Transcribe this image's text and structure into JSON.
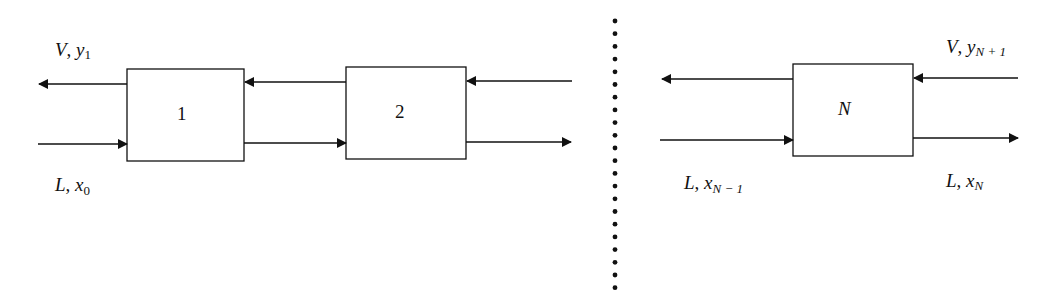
{
  "diagram": {
    "stages": [
      {
        "label": "1",
        "italic": false
      },
      {
        "label": "2",
        "italic": false
      },
      {
        "label": "N",
        "italic": true
      }
    ],
    "labels": {
      "top_left": {
        "var": "V",
        "sym": "y",
        "sub": "1"
      },
      "bottom_left": {
        "var": "L",
        "sym": "x",
        "sub": "0"
      },
      "top_right": {
        "var": "V",
        "sym": "y",
        "sub": "N + 1"
      },
      "bottom_right": {
        "var": "L",
        "sym": "x",
        "sub": "N"
      },
      "bottom_mid": {
        "var": "L",
        "sym": "x",
        "sub": "N − 1"
      }
    },
    "separator": "dotted-vertical",
    "colors": {
      "line": "#111111",
      "background": "#ffffff"
    }
  }
}
